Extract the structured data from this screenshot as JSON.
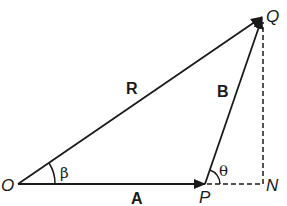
{
  "diagram": {
    "type": "vector-triangle",
    "points": {
      "O": {
        "label": "O",
        "x": 18,
        "y": 184
      },
      "P": {
        "label": "P",
        "x": 205,
        "y": 184
      },
      "N": {
        "label": "N",
        "x": 263,
        "y": 184
      },
      "Q": {
        "label": "Q",
        "x": 263,
        "y": 16
      }
    },
    "vectors": {
      "A": {
        "label": "A",
        "from": "O",
        "to": "P"
      },
      "B": {
        "label": "B",
        "from": "P",
        "to": "Q"
      },
      "R": {
        "label": "R",
        "from": "O",
        "to": "Q"
      }
    },
    "dashed_lines": [
      {
        "from": "P",
        "to": "N"
      },
      {
        "from": "N",
        "to": "Q"
      }
    ],
    "angles": {
      "beta": {
        "label": "β",
        "vertex": "O"
      },
      "theta": {
        "label": "θ",
        "vertex": "P"
      }
    },
    "colors": {
      "stroke": "#1a1a1a",
      "background": "#ffffff"
    }
  }
}
